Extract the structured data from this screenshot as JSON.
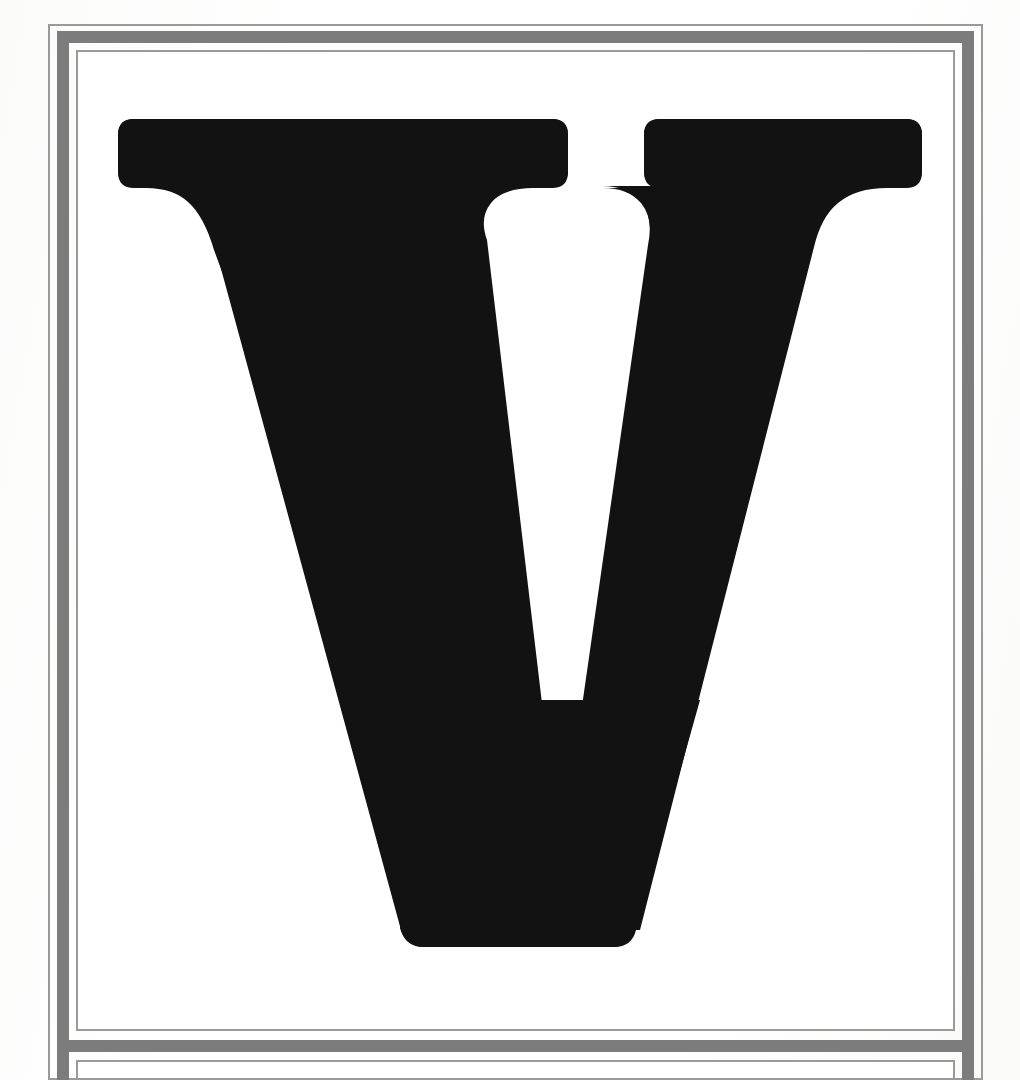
{
  "page": {
    "kind": "scanned-book-page",
    "width": 1020,
    "height": 1080,
    "background_color": "#ffffff",
    "paper_tone": "#fdfdfc",
    "caption": ""
  },
  "frame": {
    "style": "double-ruled-border",
    "rule_color": "#8e8e8e",
    "hairline_color": "#9a9a9a",
    "band_color": "#7c7c7c",
    "description": "Hairline rectangle, heavy gray band, hairline rectangle",
    "divider": {
      "name": "panel-divider",
      "orientation": "horizontal",
      "color": "#7c7c7c"
    }
  },
  "upper_panel": {
    "name": "illustration-panel",
    "content_type": "display-letter",
    "background_color": "#ffffff"
  },
  "lower_panel": {
    "name": "caption-panel",
    "content_type": "empty",
    "text": "",
    "background_color": "#ffffff"
  },
  "letter": {
    "character": "V",
    "name": "display-capital-v",
    "style": "high-contrast serif capital",
    "color": "#121212",
    "serifs": "bracketed slab serifs at both top terminals",
    "apex": "flat truncated apex at baseline",
    "cap_height_px": 828,
    "top_y": 119,
    "baseline_y": 947,
    "left_serif_x": 118,
    "right_serif_x": 922
  }
}
